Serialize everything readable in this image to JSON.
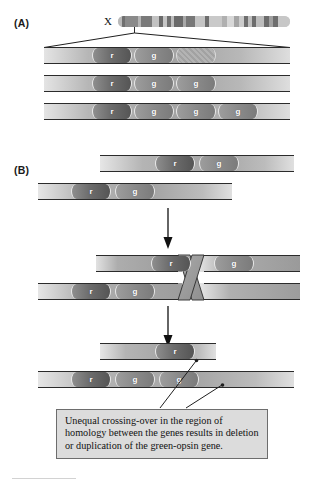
{
  "figure": {
    "panel_a_label": "(A)",
    "panel_b_label": "(B)",
    "chromosome_label": "X",
    "gene_labels": {
      "red_opsin": "r",
      "green_opsin": "g"
    }
  },
  "panel_a": {
    "label": "(A)",
    "chromosome": {
      "name": "X",
      "bands": [
        {
          "x": 0,
          "w": 4,
          "shade": "#b9b9b9"
        },
        {
          "x": 4,
          "w": 3,
          "shade": "#6f6f6f"
        },
        {
          "x": 7,
          "w": 13,
          "shade": "#8a8a8a"
        },
        {
          "x": 20,
          "w": 3,
          "shade": "#b5b5b5"
        },
        {
          "x": 23,
          "w": 11,
          "shade": "#7a7a7a"
        },
        {
          "x": 34,
          "w": 7,
          "shade": "#c2c2c2"
        },
        {
          "x": 41,
          "w": 4,
          "shade": "#6b6b6b"
        },
        {
          "x": 45,
          "w": 4,
          "shade": "#c6c6c6"
        },
        {
          "x": 49,
          "w": 4,
          "shade": "#707070"
        },
        {
          "x": 53,
          "w": 3,
          "shade": "#bdbdbd"
        },
        {
          "x": 56,
          "w": 9,
          "shade": "#6a6a6a"
        },
        {
          "x": 65,
          "w": 3,
          "shade": "#a8a8a8"
        },
        {
          "x": 68,
          "w": 9,
          "shade": "#777777"
        },
        {
          "x": 77,
          "w": 10,
          "shade": "#c4c4c4"
        },
        {
          "x": 87,
          "w": 4,
          "shade": "#6e6e6e"
        },
        {
          "x": 91,
          "w": 13,
          "shade": "#c9c9c9"
        },
        {
          "x": 104,
          "w": 5,
          "shade": "#b0b0b0"
        },
        {
          "x": 109,
          "w": 7,
          "shade": "#d8d8d8"
        },
        {
          "x": 116,
          "w": 5,
          "shade": "#a5a5a5"
        },
        {
          "x": 121,
          "w": 5,
          "shade": "#cccccc"
        },
        {
          "x": 126,
          "w": 4,
          "shade": "#6f6f6f"
        },
        {
          "x": 130,
          "w": 4,
          "shade": "#c0c0c0"
        },
        {
          "x": 134,
          "w": 4,
          "shade": "#6d6d6d"
        },
        {
          "x": 138,
          "w": 8,
          "shade": "#bdbdbd"
        },
        {
          "x": 146,
          "w": 5,
          "shade": "#6c6c6c"
        },
        {
          "x": 151,
          "w": 4,
          "shade": "#a0a0a0"
        },
        {
          "x": 155,
          "w": 5,
          "shade": "#6e6e6e"
        },
        {
          "x": 160,
          "w": 12,
          "shade": "#c7c7c7"
        }
      ]
    },
    "arrangements": [
      {
        "name": "one-red-one-green",
        "genes": [
          {
            "type": "r",
            "label": "r",
            "x": 48,
            "w": 38
          },
          {
            "type": "g",
            "label": "g",
            "x": 90,
            "w": 38
          },
          {
            "type": "ghost",
            "label": "",
            "x": 132,
            "w": 38
          }
        ]
      },
      {
        "name": "one-red-two-green",
        "genes": [
          {
            "type": "r",
            "label": "r",
            "x": 48,
            "w": 38
          },
          {
            "type": "g",
            "label": "g",
            "x": 90,
            "w": 38
          },
          {
            "type": "g",
            "label": "g",
            "x": 132,
            "w": 38
          }
        ]
      },
      {
        "name": "one-red-three-green",
        "genes": [
          {
            "type": "r",
            "label": "r",
            "x": 48,
            "w": 38
          },
          {
            "type": "g",
            "label": "g",
            "x": 90,
            "w": 38
          },
          {
            "type": "g",
            "label": "g",
            "x": 132,
            "w": 38
          },
          {
            "type": "g",
            "label": "g",
            "x": 174,
            "w": 38
          }
        ]
      }
    ]
  },
  "panel_b": {
    "label": "(B)",
    "stage1": {
      "name": "aligned-homologues",
      "chromatids": [
        {
          "genes": [
            {
              "type": "r",
              "label": "r",
              "x": 55,
              "w": 38
            },
            {
              "type": "g",
              "label": "g",
              "x": 99,
              "w": 38
            }
          ]
        },
        {
          "genes": [
            {
              "type": "r",
              "label": "r",
              "x": 33,
              "w": 38
            },
            {
              "type": "g",
              "label": "g",
              "x": 77,
              "w": 38
            }
          ]
        }
      ]
    },
    "stage2": {
      "name": "misaligned-crossover",
      "chromatids": [
        {
          "genes": [
            {
              "type": "r",
              "label": "r",
              "x": 55,
              "w": 38
            },
            {
              "type": "g",
              "label": "g",
              "x": 118,
              "w": 38
            }
          ]
        },
        {
          "genes": [
            {
              "type": "r",
              "label": "r",
              "x": 33,
              "w": 38
            },
            {
              "type": "g",
              "label": "g",
              "x": 77,
              "w": 38
            }
          ]
        }
      ]
    },
    "stage3": {
      "name": "deletion-and-duplication-products",
      "chromatids": [
        {
          "name": "deletion-product",
          "genes": [
            {
              "type": "r",
              "label": "r",
              "x": 55,
              "w": 38
            }
          ]
        },
        {
          "name": "duplication-product",
          "genes": [
            {
              "type": "r",
              "label": "r",
              "x": 33,
              "w": 38
            },
            {
              "type": "g",
              "label": "g",
              "x": 77,
              "w": 38
            },
            {
              "type": "g",
              "label": "g",
              "x": 121,
              "w": 38
            }
          ]
        }
      ]
    }
  },
  "caption": {
    "text": "Unequal crossing-over in the region of homology between the genes results in deletion or duplication of the green-opsin gene."
  }
}
